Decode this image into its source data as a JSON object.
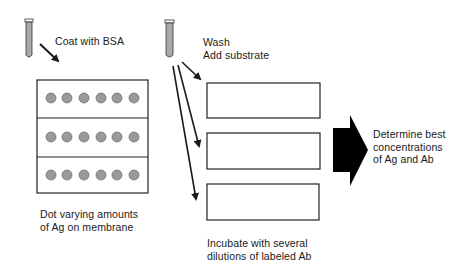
{
  "diagram": {
    "steps": {
      "coat": {
        "label": "Coat with BSA"
      },
      "dot": {
        "lines": [
          "Dot varying amounts",
          "of Ag on membrane"
        ]
      },
      "wash": {
        "lines": [
          "Wash",
          "Add substrate"
        ]
      },
      "incubate": {
        "lines": [
          "Incubate with several",
          "dilutions of labeled Ab"
        ]
      },
      "determine": {
        "lines": [
          "Determine best",
          "concentrations",
          "of Ag and Ab"
        ]
      }
    },
    "membrane": {
      "rows": 3,
      "dots_per_row": 6
    },
    "strips": {
      "count": 3
    },
    "colors": {
      "ink": "#1a1a1a",
      "dot_fill": "#9a9a9a",
      "tube_fill": "#a8a8a8",
      "arrow_fill": "#000000"
    }
  }
}
